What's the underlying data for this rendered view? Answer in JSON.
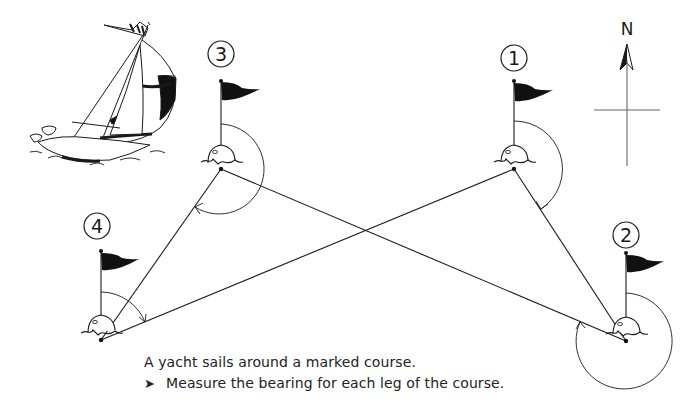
{
  "diagram": {
    "north_label": "N",
    "buoys": [
      {
        "id": "1",
        "label": "1",
        "x": 514,
        "y": 169
      },
      {
        "id": "2",
        "label": "2",
        "x": 626,
        "y": 341
      },
      {
        "id": "3",
        "label": "3",
        "x": 221,
        "y": 169
      },
      {
        "id": "4",
        "label": "4",
        "x": 101,
        "y": 340
      }
    ],
    "legs": [
      {
        "from": "1",
        "to": "2"
      },
      {
        "from": "2",
        "to": "3"
      },
      {
        "from": "3",
        "to": "4"
      },
      {
        "from": "4",
        "to": "1"
      }
    ],
    "colors": {
      "line": "#1a1a1a",
      "flag": "#111111",
      "background": "#ffffff"
    }
  },
  "caption": {
    "line1": "A yacht sails around a marked course.",
    "bullet_icon": "➤",
    "line2": "Measure the bearing for each leg of the course."
  }
}
